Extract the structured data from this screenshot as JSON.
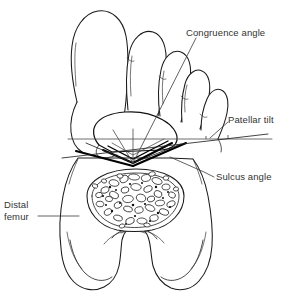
{
  "figure": {
    "kind": "line-drawing",
    "background_color": "#ffffff",
    "ink_color": "#1a1a1a",
    "label_color": "#333333"
  },
  "labels": {
    "congruence_angle": "Congruence angle",
    "patellar_tilt": "Patellar tilt",
    "sulcus_angle": "Sulcus angle",
    "distal_femur_line1": "Distal",
    "distal_femur_line2": "femur"
  },
  "annotations": [
    {
      "id": "congruence-angle",
      "text": "Congruence angle",
      "leader_from": [
        184,
        33
      ],
      "leader_to": [
        133,
        163
      ],
      "measure_type": "angle-between-bisector-and-sulcus-apex-ray"
    },
    {
      "id": "patellar-tilt",
      "text": "Patellar tilt",
      "leader_from": [
        226,
        120
      ],
      "leader_to": [
        209,
        136
      ],
      "measure_type": "angle-between-horizontal-reference-and-patellar-transverse-axis"
    },
    {
      "id": "sulcus-angle",
      "text": "Sulcus angle",
      "leader_from": [
        214,
        177
      ],
      "leader_to": [
        168,
        160
      ],
      "measure_type": "angle-at-trochlear-sulcus-apex"
    },
    {
      "id": "distal-femur",
      "text": "Distal femur",
      "leader_from": [
        46,
        216
      ],
      "leader_to": [
        78,
        216
      ],
      "measure_type": "part-callout"
    }
  ],
  "parts": [
    {
      "id": "toes-outline",
      "name": "toes / forefoot outline (superimposed)"
    },
    {
      "id": "patella",
      "name": "patella"
    },
    {
      "id": "patella-ridge",
      "name": "patellar median ridge"
    },
    {
      "id": "trochlea",
      "name": "femoral trochlea"
    },
    {
      "id": "cancellous-bone",
      "name": "cancellous bone cross-section"
    },
    {
      "id": "medial-condyle",
      "name": "medial femoral condyle"
    },
    {
      "id": "lateral-condyle",
      "name": "lateral femoral condyle"
    },
    {
      "id": "intercondylar-notch",
      "name": "intercondylar notch"
    }
  ],
  "geometry": {
    "sulcus_apex": [
      133,
      163
    ],
    "horizontal_reference_y": 139,
    "horizontal_reference_x_range": [
      68,
      272
    ],
    "patella_center": [
      133,
      133
    ]
  }
}
